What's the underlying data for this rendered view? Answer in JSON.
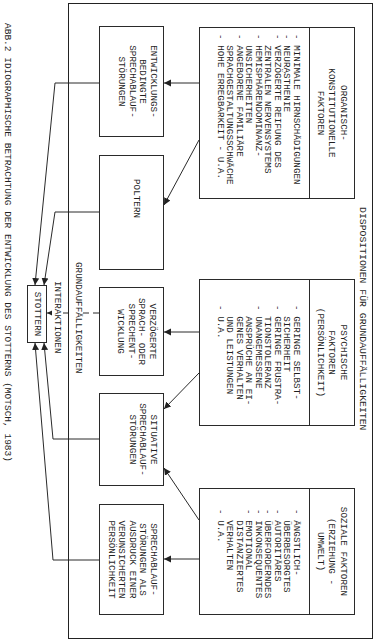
{
  "caption": "ABB.2 IDIOGRAPHISCHE BETRACHTUNG DER ENTWICKLUNG DES STOTTERNS (MOTSCH, 1983)",
  "frame": {
    "title": "DISPOSITIONEN FÜR GRUNDAUFFÄLLIGKEITEN",
    "bus_label": "GRUNDAUFFÄLLIGKEITEN"
  },
  "interaction_label": "INTERAKTIONEN",
  "center": {
    "label": "STOTTERN"
  },
  "factors": [
    {
      "id": "organic",
      "title": [
        "ORGANISCH-",
        "KONSTITUTIONELLE",
        "FAKTOREN"
      ],
      "lines": [
        {
          "bullet": "-",
          "text": "MINIMALE HIRNSCHÄDIGUNGEN"
        },
        {
          "bullet": "-",
          "text": "NEURASTHENIE"
        },
        {
          "bullet": "-",
          "text": "VERZÖGERTE REIFUNG DES"
        },
        {
          "bullet": "",
          "text": "ZENTRALEN NERVENSYSTEMS"
        },
        {
          "bullet": "-",
          "text": "HEMISPHÄRENDOMINANZ-"
        },
        {
          "bullet": "",
          "text": "UNSICHERHEITEN"
        },
        {
          "bullet": "-",
          "text": "ANGEBORENE FAMILIÄRE"
        },
        {
          "bullet": "",
          "text": "SPRACHGESTALTUNGSSCHWÄCHE"
        },
        {
          "bullet": "-",
          "text": "HOHE ERREGBARKEIT - U.A."
        }
      ]
    },
    {
      "id": "psychic",
      "title": [
        "PSYCHISCHE",
        "FAKTOREN",
        "(PERSÖNLICHKEIT)"
      ],
      "lines": [
        {
          "bullet": "-",
          "text": "GERINGE SELBST-"
        },
        {
          "bullet": "",
          "text": "SICHERHEIT"
        },
        {
          "bullet": "-",
          "text": "GERINGE FRUSTRA-"
        },
        {
          "bullet": "",
          "text": "TIONSTOLERANZ"
        },
        {
          "bullet": "-",
          "text": "UNANGEMESSENE"
        },
        {
          "bullet": "",
          "text": "ANSPRÜCHE AN EI-"
        },
        {
          "bullet": "",
          "text": "GENES VERHALTEN"
        },
        {
          "bullet": "",
          "text": "UND LEISTUNGEN"
        },
        {
          "bullet": "-",
          "text": "U.A."
        }
      ]
    },
    {
      "id": "social",
      "title": [
        "SOZIALE FAKTOREN",
        "(ERZIEHUNG -",
        "UMWELT)"
      ],
      "lines": [
        {
          "bullet": "-",
          "text": "ÄNGSTLICH-"
        },
        {
          "bullet": "",
          "text": "ÜBERBESORGTES"
        },
        {
          "bullet": "-",
          "text": "AUTORITÄRES"
        },
        {
          "bullet": "-",
          "text": "ÜBERFORDERNDES"
        },
        {
          "bullet": "-",
          "text": "INKONSEQUENTES"
        },
        {
          "bullet": "-",
          "text": "EMOTIONAL"
        },
        {
          "bullet": "",
          "text": "DISTANZIERTES"
        },
        {
          "bullet": "",
          "text": "VERHALTEN"
        },
        {
          "bullet": "-",
          "text": "U.A."
        }
      ]
    }
  ],
  "outcomes": [
    {
      "id": "entwicklungsbedingt",
      "lines": [
        "ENTWICKLUNGS-",
        "BEDINGTE",
        "SPRECHABLAUF-",
        "STÖRUNGEN"
      ]
    },
    {
      "id": "poltern",
      "lines": [
        "POLTERN"
      ]
    },
    {
      "id": "verzoegert",
      "lines": [
        "VERZÖGERTE",
        "SPRACH- ODER",
        "SPRECHENT-",
        "WICKLUNG"
      ]
    },
    {
      "id": "situativ",
      "lines": [
        "SITUATIVE",
        "SPRECHABLAUF-",
        "STÖRUNGEN"
      ]
    },
    {
      "id": "persoenlichkeit",
      "lines": [
        "SPRECHABLAUF-",
        "STÖRUNGEN ALS",
        "AUSDRUCK EINER",
        "VERUNSICHERTEN",
        "PERSÖNLICHKEIT"
      ]
    }
  ],
  "edges": [
    {
      "from": "organic",
      "to": "entwicklungsbedingt",
      "style": "solid"
    },
    {
      "from": "organic",
      "to": "poltern",
      "style": "solid"
    },
    {
      "from": "psychic",
      "to": "verzoegert",
      "style": "solid"
    },
    {
      "from": "psychic",
      "to": "situativ",
      "style": "solid"
    },
    {
      "from": "social",
      "to": "situativ",
      "style": "solid"
    },
    {
      "from": "social",
      "to": "persoenlichkeit",
      "style": "solid"
    },
    {
      "from": "entwicklungsbedingt",
      "to": "stottern",
      "style": "solid"
    },
    {
      "from": "poltern",
      "to": "stottern",
      "style": "solid"
    },
    {
      "from": "verzoegert",
      "to": "stottern",
      "style": "dashed"
    },
    {
      "from": "situativ",
      "to": "stottern",
      "style": "solid"
    },
    {
      "from": "persoenlichkeit",
      "to": "stottern",
      "style": "solid"
    }
  ],
  "colors": {
    "ink": "#1f1f1f",
    "background": "#ffffff"
  }
}
